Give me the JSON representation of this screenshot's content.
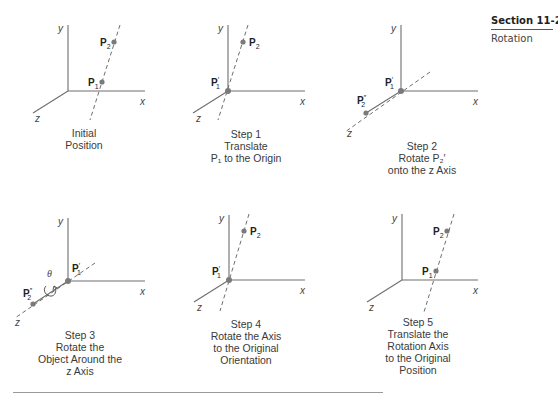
{
  "section": {
    "number": "Section 11-2",
    "title": "Rotation"
  },
  "axis_labels": {
    "x": "x",
    "y": "y",
    "z": "z"
  },
  "point_labels": {
    "p1": "P",
    "p1_sub": "1",
    "p2": "P",
    "p2_sub": "2",
    "p1_prime": "P",
    "p1_prime_sub": "1",
    "p1_prime_mark": "′",
    "p2_dblprime": "P",
    "p2_dblprime_sub": "2",
    "p2_dblprime_mark": "″"
  },
  "theta": "θ",
  "panels": [
    {
      "id": "initial",
      "caption": [
        "Initial",
        "Position"
      ]
    },
    {
      "id": "step1",
      "caption": [
        "Step 1",
        "Translate",
        "P₁ to the Origin"
      ]
    },
    {
      "id": "step2",
      "caption": [
        "Step 2",
        "Rotate P₂′",
        "onto the z Axis"
      ]
    },
    {
      "id": "step3",
      "caption": [
        "Step 3",
        "Rotate the",
        "Object Around the",
        "z Axis"
      ]
    },
    {
      "id": "step4",
      "caption": [
        "Step 4",
        "Rotate the Axis",
        "to the Original",
        "Orientation"
      ]
    },
    {
      "id": "step5",
      "caption": [
        "Step 5",
        "Translate the",
        "Rotation Axis",
        "to the Original",
        "Position"
      ]
    }
  ]
}
